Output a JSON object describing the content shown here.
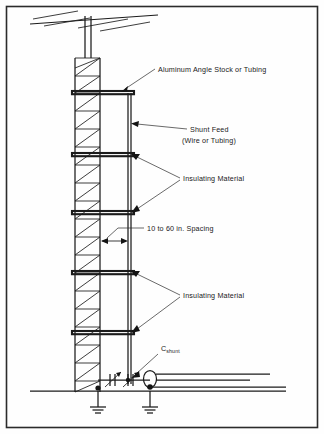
{
  "figure": {
    "kind": "technical-line-drawing",
    "background_color": "#fefefe",
    "ink_color": "#1b1b1b"
  },
  "border": {
    "name": "figure-frame",
    "x": 6,
    "y": 6,
    "width": 312,
    "height": 422,
    "stroke": "#2b2b2b"
  },
  "labels": [
    {
      "id": "aluminum-angle-stock",
      "text": "Aluminum Angle Stock or Tubing",
      "x": 158,
      "y": 72,
      "anchor": "start"
    },
    {
      "id": "shunt-feed-line1",
      "text": "Shunt Feed",
      "x": 190,
      "y": 132,
      "anchor": "start"
    },
    {
      "id": "shunt-feed-line2",
      "text": "(Wire or Tubing)",
      "x": 182,
      "y": 143,
      "anchor": "start"
    },
    {
      "id": "insulating-material-upper",
      "text": "Insulating Material",
      "x": 183,
      "y": 181,
      "anchor": "start"
    },
    {
      "id": "spacing-dimension",
      "text": "10 to 60 in. Spacing",
      "x": 147,
      "y": 231,
      "anchor": "start"
    },
    {
      "id": "insulating-material-lower",
      "text": "Insulating Material",
      "x": 183,
      "y": 298,
      "anchor": "start"
    }
  ],
  "capacitor_label": {
    "id": "c-shunt",
    "symbol": "C",
    "subscript": "shunt",
    "x": 161,
    "y": 351
  },
  "tower": {
    "left_leg_x": 75,
    "right_leg_x": 100,
    "top_y": 58,
    "base_y": 392,
    "brace_count": 18
  },
  "mast": {
    "left_x": 85,
    "right_x": 91,
    "top_y": 16,
    "bottom_y": 58
  },
  "antenna": {
    "type": "yagi",
    "boom_y": 19,
    "boom_x1": 30,
    "boom_x2": 158,
    "element_count": 4
  },
  "shunt_feed": {
    "wire_x": 128,
    "top_y": 93,
    "bottom_y": 382
  },
  "rails": [
    {
      "id": "rail-1",
      "y": 93
    },
    {
      "id": "rail-2",
      "y": 155
    },
    {
      "id": "rail-3",
      "y": 213
    },
    {
      "id": "rail-4",
      "y": 273
    },
    {
      "id": "rail-5",
      "y": 333
    }
  ],
  "ground": {
    "line_y": 392,
    "x1": 30,
    "x2": 286,
    "symbols": [
      {
        "id": "ground-symbol-tower",
        "x": 98
      },
      {
        "id": "ground-symbol-coax",
        "x": 150
      }
    ]
  },
  "capacitors": [
    {
      "id": "variable-capacitor-1",
      "x": 113
    },
    {
      "id": "variable-capacitor-2",
      "x": 131
    }
  ],
  "coax": {
    "feed_x": 150,
    "upper_y": 374,
    "lower_y": 384,
    "end_x": 286
  }
}
